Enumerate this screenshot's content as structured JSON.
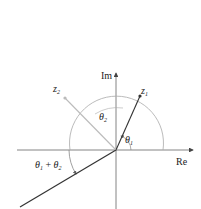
{
  "diagram": {
    "axes": {
      "x_label": "Re",
      "y_label": "Im"
    },
    "points": [
      {
        "name": "z1",
        "label_main": "z",
        "label_sub": "1"
      },
      {
        "name": "z2",
        "label_main": "z",
        "label_sub": "2"
      }
    ],
    "angles": {
      "theta1": {
        "main": "θ",
        "sub": "1"
      },
      "theta2": {
        "main": "θ",
        "sub": "2"
      },
      "sum": {
        "a_main": "θ",
        "a_sub": "1",
        "op": " + ",
        "b_main": "θ",
        "b_sub": "2"
      }
    },
    "colors": {
      "axis": "#555555",
      "dark_line": "#333333",
      "light_line": "#bbbbbb",
      "arc": "#999999"
    }
  }
}
